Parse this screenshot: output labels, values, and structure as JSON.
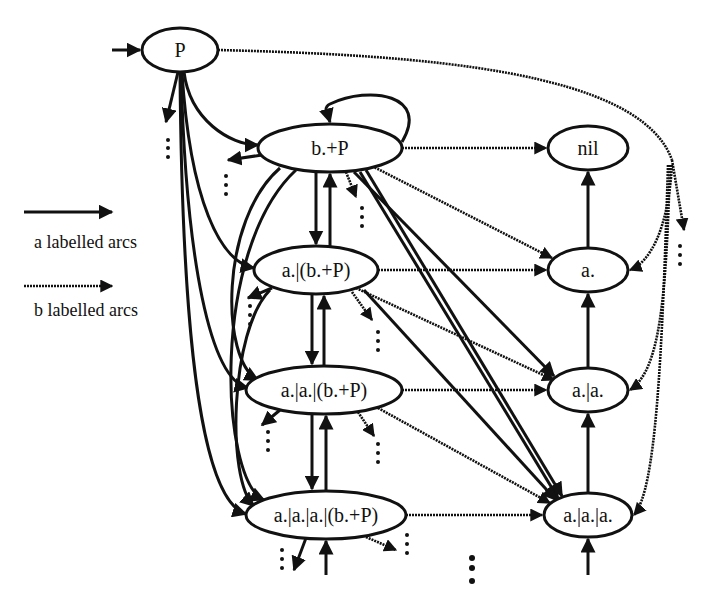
{
  "diagram": {
    "type": "labelled transition graph",
    "nodes": [
      {
        "id": "P",
        "label": "P",
        "cx": 180,
        "cy": 50,
        "rx": 38,
        "ry": 22
      },
      {
        "id": "bP",
        "label": "b.+P",
        "cx": 330,
        "cy": 148,
        "rx": 72,
        "ry": 24
      },
      {
        "id": "nil",
        "label": "nil",
        "cx": 588,
        "cy": 148,
        "rx": 40,
        "ry": 22
      },
      {
        "id": "a_bP",
        "label": "a.|(b.+P)",
        "cx": 316,
        "cy": 270,
        "rx": 62,
        "ry": 24
      },
      {
        "id": "a",
        "label": "a.",
        "cx": 588,
        "cy": 270,
        "rx": 40,
        "ry": 22
      },
      {
        "id": "aa_bP",
        "label": "a.|a.|(b.+P)",
        "cx": 324,
        "cy": 390,
        "rx": 78,
        "ry": 24
      },
      {
        "id": "aa",
        "label": "a.|a.",
        "cx": 588,
        "cy": 390,
        "rx": 40,
        "ry": 22
      },
      {
        "id": "aaa_bP",
        "label": "a.|a.|a.|(b.+P)",
        "cx": 326,
        "cy": 515,
        "rx": 80,
        "ry": 24
      },
      {
        "id": "aaa",
        "label": "a.|a.|a.",
        "cx": 588,
        "cy": 515,
        "rx": 44,
        "ry": 22
      }
    ],
    "legend": {
      "a_arcs_label": "a labelled arcs",
      "b_arcs_label": "b labelled arcs"
    },
    "arc_types": {
      "a": "solid",
      "b": "wavy/dotted"
    },
    "continuation_marker": "⋮"
  }
}
